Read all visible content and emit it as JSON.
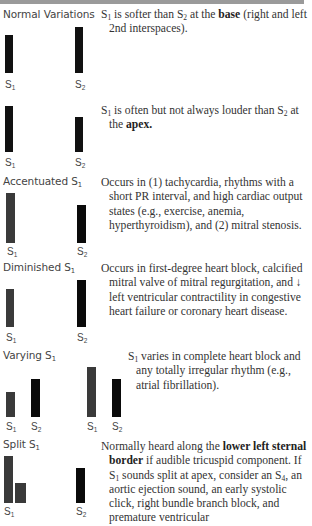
{
  "sections": [
    {
      "title": "Normal Variations",
      "rows": [
        {
          "text_html": "S<sub>1</sub> is softer than S<sub>2</sub> at the <b>base</b> (right and left 2nd interspaces).",
          "bars": [
            {
              "label": "S",
              "sub": "1",
              "height": 38
            },
            {
              "label": "S",
              "sub": "2",
              "height": 46
            }
          ]
        },
        {
          "text_html": "S<sub>1</sub> is often but not always louder than S<sub>2</sub> at the <b>apex.</b>",
          "bars": [
            {
              "label": "S",
              "sub": "1",
              "height": 46
            },
            {
              "label": "S",
              "sub": "2",
              "height": 35
            }
          ]
        }
      ]
    },
    {
      "title": "Accentuated S",
      "title_sub": "1",
      "text_html": "Occurs in (1) tachycardia, rhythms with a short PR interval, and high cardiac output states (e.g., exercise, anemia, hyperthyroidism), and (2) mitral stenosis.",
      "bars": [
        {
          "label": "S",
          "sub": "1",
          "height": 50
        },
        {
          "label": "S",
          "sub": "2",
          "height": 38
        }
      ]
    },
    {
      "title": "Diminished S",
      "title_sub": "1",
      "text_html": "Occurs in first-degree heart block, calcified mitral valve of mitral regurgitation, and &darr; left ventricular contractility in congestive heart failure or coronary heart disease.",
      "bars": [
        {
          "label": "S",
          "sub": "1",
          "height": 38
        },
        {
          "label": "S",
          "sub": "2",
          "height": 47
        }
      ]
    },
    {
      "title": "Varying S",
      "title_sub": "1",
      "text_html": "S<sub>1</sub> varies in complete heart block and any totally irregular rhythm (e.g., atrial fibrillation).",
      "bars": [
        {
          "label": "S",
          "sub": "1",
          "height": 25
        },
        {
          "label": "S",
          "sub": "2",
          "height": 38
        },
        {
          "label": "S",
          "sub": "1",
          "height": 50
        },
        {
          "label": "S",
          "sub": "2",
          "height": 38
        }
      ]
    },
    {
      "title": "Split S",
      "title_sub": "1",
      "text_html": "Normally heard along the <b>lower left sternal border</b> if audible tricuspid component. If S<sub>1</sub> sounds split at apex, consider an S<sub>4</sub>, an aortic ejection sound, an early systolic click, right bundle branch block, and premature ventricular",
      "bars": [
        {
          "label": "S",
          "sub": "1",
          "height": 47,
          "split_height": 20
        },
        {
          "label": "S",
          "sub": "2",
          "height": 35
        }
      ]
    }
  ],
  "labels": {
    "s": "S",
    "one": "1",
    "two": "2"
  }
}
